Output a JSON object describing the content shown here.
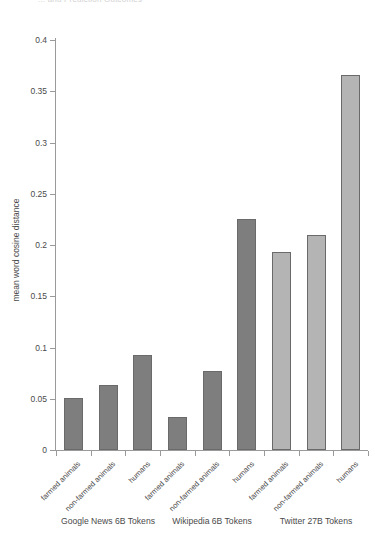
{
  "top_title_sliver": "... and Prediction Outcomes",
  "chart_data": {
    "type": "bar",
    "title": "",
    "xlabel": "",
    "ylabel": "mean word cosine distance",
    "ylim": [
      0,
      0.4
    ],
    "yticks": [
      0,
      0.05,
      0.1,
      0.15,
      0.2,
      0.25,
      0.3,
      0.35,
      0.4
    ],
    "ytick_labels": [
      "0",
      "0.05",
      "0.1",
      "0.15",
      "0.2",
      "0.25",
      "0.3",
      "0.35",
      "0.4"
    ],
    "grid": false,
    "legend": "none",
    "categories": [
      "farmed animals",
      "non-farmed animals",
      "humans",
      "farmed animals",
      "non-farmed animals",
      "humans",
      "farmed animals",
      "non-farmed animals",
      "humans"
    ],
    "values": [
      0.051,
      0.063,
      0.093,
      0.032,
      0.077,
      0.225,
      0.193,
      0.21,
      0.366
    ],
    "bar_colors": [
      "#7e7e7e",
      "#7e7e7e",
      "#7e7e7e",
      "#7e7e7e",
      "#7e7e7e",
      "#7e7e7e",
      "#b4b4b4",
      "#b4b4b4",
      "#b4b4b4"
    ],
    "groups": [
      {
        "label": "Google News 6B Tokens",
        "categories": [
          "farmed animals",
          "non-farmed animals",
          "humans"
        ],
        "values": [
          0.051,
          0.063,
          0.093
        ]
      },
      {
        "label": "Wikipedia 6B Tokens",
        "categories": [
          "farmed animals",
          "non-farmed animals",
          "humans"
        ],
        "values": [
          0.032,
          0.077,
          0.225
        ]
      },
      {
        "label": "Twitter 27B Tokens",
        "categories": [
          "farmed animals",
          "non-farmed animals",
          "humans"
        ],
        "values": [
          0.193,
          0.21,
          0.366
        ]
      }
    ],
    "group_labels": [
      "Google News 6B Tokens",
      "Wikipedia 6B Tokens",
      "Twitter 27B Tokens"
    ]
  }
}
